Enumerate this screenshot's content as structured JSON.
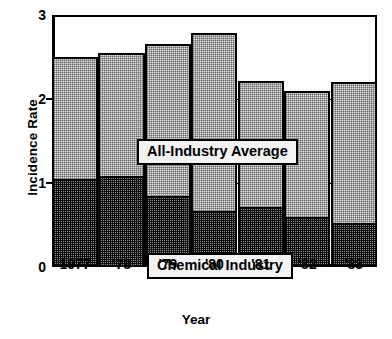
{
  "chart_data": {
    "type": "bar",
    "subtype": "overlaid-grouped-bars",
    "title": "",
    "xlabel": "Year",
    "ylabel": "Incidence Rate",
    "categories": [
      "1977",
      "'78",
      "'79",
      "'80",
      "'81",
      "'82",
      "'83"
    ],
    "ylim": [
      0,
      3
    ],
    "yticks": [
      0,
      1,
      2,
      3
    ],
    "ytick_labels": [
      "0",
      "1",
      "2",
      "3"
    ],
    "grid": true,
    "grid_axis": "y",
    "legend_position": "inside-plot",
    "series": [
      {
        "name": "All-Industry Average",
        "values": [
          2.5,
          2.55,
          2.65,
          2.78,
          2.22,
          2.1,
          2.2
        ],
        "fill": "light-stipple",
        "color": "#e3e3e3"
      },
      {
        "name": "Chemical Industry",
        "values": [
          1.05,
          1.08,
          0.85,
          0.67,
          0.72,
          0.6,
          0.52
        ],
        "fill": "dark-stipple",
        "color": "#8a8a8a"
      }
    ],
    "annotations": [
      {
        "text": "All-Industry Average",
        "target": "series-1"
      },
      {
        "text": "Chemical Industry",
        "target": "series-2"
      }
    ]
  },
  "axes": {
    "y_title": "Incidence Rate",
    "x_title": "Year",
    "y_ticks": [
      {
        "label": "3",
        "value": 3
      },
      {
        "label": "2",
        "value": 2
      },
      {
        "label": "1",
        "value": 1
      },
      {
        "label": "0",
        "value": 0
      }
    ],
    "x_ticks": [
      {
        "label": "1977"
      },
      {
        "label": "'78"
      },
      {
        "label": "'79"
      },
      {
        "label": "'80"
      },
      {
        "label": "'81"
      },
      {
        "label": "'82"
      },
      {
        "label": "'83"
      }
    ]
  },
  "legend": {
    "all_industry": "All-Industry Average",
    "chemical": "Chemical Industry"
  },
  "colors": {
    "axis": "#000000",
    "grid": "#000000",
    "all_industry_fill": "#e3e3e3",
    "chemical_fill": "#8a8a8a",
    "background": "#ffffff"
  }
}
